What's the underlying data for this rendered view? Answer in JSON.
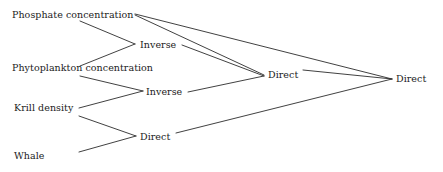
{
  "diagram": {
    "type": "concept-map",
    "background_color": "#ffffff",
    "line_color": "#2b2b2b",
    "text_color": "#1b1b1b",
    "leaves": [
      {
        "id": "phosphate",
        "label": "Phosphate concentration",
        "x": 12,
        "y": 9
      },
      {
        "id": "phytoplankton",
        "label": "Phytoplankton concentration",
        "x": 12,
        "y": 62
      },
      {
        "id": "krill",
        "label": "Krill density",
        "x": 14,
        "y": 102
      },
      {
        "id": "whale",
        "label": "Whale",
        "x": 14,
        "y": 150
      }
    ],
    "relations": [
      {
        "id": "inverse-1",
        "label": "Inverse",
        "x": 140,
        "y": 39
      },
      {
        "id": "inverse-2",
        "label": "Inverse",
        "x": 146,
        "y": 86
      },
      {
        "id": "direct-1",
        "label": "Direct",
        "x": 140,
        "y": 131
      },
      {
        "id": "direct-2",
        "label": "Direct",
        "x": 268,
        "y": 69
      },
      {
        "id": "direct-3",
        "label": "Direct",
        "x": 396,
        "y": 73
      }
    ],
    "edges": [
      {
        "from": "phosphate",
        "to": "inverse-1",
        "x1": 80,
        "y1": 21,
        "x2": 135,
        "y2": 44
      },
      {
        "from": "phytoplankton",
        "to": "inverse-1",
        "x1": 80,
        "y1": 66,
        "x2": 135,
        "y2": 44
      },
      {
        "from": "phytoplankton",
        "to": "inverse-2",
        "x1": 80,
        "y1": 76,
        "x2": 143,
        "y2": 91
      },
      {
        "from": "krill",
        "to": "inverse-2",
        "x1": 79,
        "y1": 108,
        "x2": 143,
        "y2": 91
      },
      {
        "from": "krill",
        "to": "direct-1",
        "x1": 79,
        "y1": 116,
        "x2": 136,
        "y2": 136
      },
      {
        "from": "whale",
        "to": "direct-1",
        "x1": 79,
        "y1": 152,
        "x2": 136,
        "y2": 136
      },
      {
        "from": "inverse-1",
        "to": "direct-2",
        "x1": 182,
        "y1": 45,
        "x2": 264,
        "y2": 76
      },
      {
        "from": "inverse-2",
        "to": "direct-2",
        "x1": 188,
        "y1": 92,
        "x2": 264,
        "y2": 76
      },
      {
        "from": "direct-2",
        "to": "direct-3",
        "x1": 303,
        "y1": 70,
        "x2": 392,
        "y2": 79
      },
      {
        "from": "direct-1",
        "to": "direct-3",
        "x1": 176,
        "y1": 133,
        "x2": 392,
        "y2": 79
      },
      {
        "from": "phosphate",
        "to": "direct-3",
        "x1": 135,
        "y1": 14,
        "x2": 392,
        "y2": 79
      },
      {
        "from": "phosphate",
        "to": "direct-2",
        "x1": 135,
        "y1": 15,
        "x2": 264,
        "y2": 75
      }
    ]
  }
}
